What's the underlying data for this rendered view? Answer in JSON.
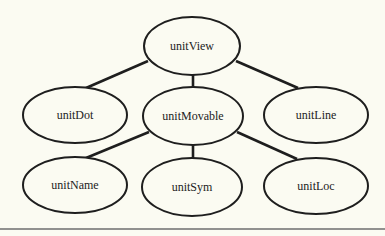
{
  "diagram": {
    "background": "#fbfbf2",
    "stroke_color": "#1e1e1e",
    "rule_color": "#6e6e6e",
    "nodes": [
      {
        "id": "unitView",
        "label": "unitView",
        "cx": 192,
        "cy": 46,
        "rx": 48,
        "ry": 29
      },
      {
        "id": "unitDot",
        "label": "unitDot",
        "cx": 75,
        "cy": 115,
        "rx": 52,
        "ry": 28
      },
      {
        "id": "unitMovable",
        "label": "unitMovable",
        "cx": 193,
        "cy": 116,
        "rx": 50,
        "ry": 29
      },
      {
        "id": "unitLine",
        "label": "unitLine",
        "cx": 316,
        "cy": 115,
        "rx": 52,
        "ry": 28
      },
      {
        "id": "unitName",
        "label": "unitName",
        "cx": 75,
        "cy": 185,
        "rx": 52,
        "ry": 28
      },
      {
        "id": "unitSym",
        "label": "unitSym",
        "cx": 192,
        "cy": 187,
        "rx": 50,
        "ry": 29
      },
      {
        "id": "unitLoc",
        "label": "unitLoc",
        "cx": 316,
        "cy": 186,
        "rx": 52,
        "ry": 28
      }
    ],
    "edges": [
      {
        "from": "unitView",
        "to": "unitDot",
        "x1": 148,
        "y1": 61,
        "x2": 86,
        "y2": 88
      },
      {
        "from": "unitView",
        "to": "unitMovable",
        "x1": 193,
        "y1": 75,
        "x2": 193,
        "y2": 87
      },
      {
        "from": "unitView",
        "to": "unitLine",
        "x1": 236,
        "y1": 61,
        "x2": 298,
        "y2": 88
      },
      {
        "from": "unitMovable",
        "to": "unitName",
        "x1": 149,
        "y1": 132,
        "x2": 86,
        "y2": 158
      },
      {
        "from": "unitMovable",
        "to": "unitSym",
        "x1": 193,
        "y1": 145,
        "x2": 193,
        "y2": 158
      },
      {
        "from": "unitMovable",
        "to": "unitLoc",
        "x1": 237,
        "y1": 132,
        "x2": 297,
        "y2": 159
      }
    ],
    "rule": {
      "x1": 0,
      "y1": 229,
      "x2": 385,
      "y2": 229
    }
  }
}
